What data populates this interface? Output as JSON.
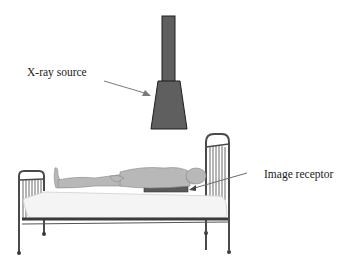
{
  "diagram": {
    "title": "",
    "labels": {
      "xray_source": "X-ray source",
      "image_receptor": "Image receptor"
    },
    "components": [
      "x-ray tube column",
      "x-ray tube head",
      "patient",
      "bed",
      "image receptor"
    ],
    "colors": {
      "tube": "#5f5f5f",
      "tube_outline": "#1e1e1e",
      "arrow": "#7a7a7a",
      "bed_frame": "#4a4a4a",
      "mattress": "#f4f4f4",
      "receptor": "#5a5a5a",
      "patient": "#b8b8b8"
    }
  }
}
